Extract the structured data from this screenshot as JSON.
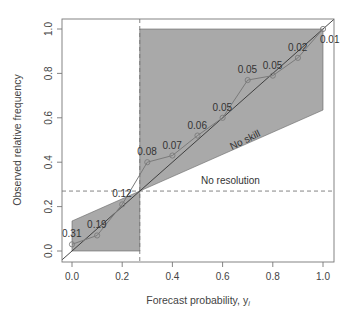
{
  "chart_data": {
    "type": "line",
    "title": "",
    "xlabel": "Forecast probability, y",
    "xlabel_subscript": "i",
    "ylabel": "Observed relative frequency",
    "xlim": [
      0,
      1
    ],
    "ylim": [
      0,
      1
    ],
    "x_ticks": [
      "0.0",
      "0.2",
      "0.4",
      "0.6",
      "0.8",
      "1.0"
    ],
    "y_ticks": [
      "0.0",
      "0.2",
      "0.4",
      "0.6",
      "0.8",
      "1.0"
    ],
    "grid": false,
    "legend": null,
    "climatology": 0.27,
    "series": [
      {
        "name": "Reliability curve",
        "x": [
          0.0,
          0.1,
          0.2,
          0.3,
          0.4,
          0.5,
          0.6,
          0.7,
          0.8,
          0.9,
          1.0
        ],
        "y": [
          0.03,
          0.07,
          0.21,
          0.4,
          0.43,
          0.52,
          0.6,
          0.77,
          0.79,
          0.87,
          1.0
        ],
        "point_labels": [
          "0.31",
          "0.19",
          "0.12",
          "0.08",
          "0.07",
          "0.06",
          "0.05",
          "0.05",
          "0.05",
          "0.02",
          "0.01"
        ]
      }
    ],
    "reference_lines": [
      {
        "name": "Perfect reliability",
        "type": "diagonal"
      },
      {
        "name": "No skill",
        "slope": 0.5,
        "through_climatology": true
      },
      {
        "name": "No resolution",
        "type": "horizontal",
        "y": 0.27,
        "style": "dashed"
      },
      {
        "name": "Climatology forecast",
        "type": "vertical",
        "x": 0.27,
        "style": "dashed"
      }
    ],
    "annotations": [
      "No skill",
      "No resolution"
    ],
    "shaded_region": "skill region between no-skill line and perfect-forecast bounds",
    "colors": {
      "shade": "#a9a9a9",
      "curve": "#7a7a7a",
      "diagonal": "#333333",
      "dashed": "#777777"
    }
  }
}
